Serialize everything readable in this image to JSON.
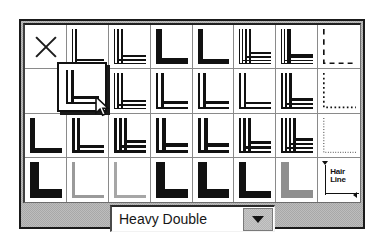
{
  "dialog": {
    "name": "border-style-picker",
    "panel_color": "#a8a8a8",
    "grid_bg": "#ffffff",
    "ink_color": "#111111"
  },
  "grid": {
    "rows": 4,
    "cols": 8,
    "cells": [
      {
        "id": "none",
        "label": "None",
        "kind": "x"
      },
      {
        "id": "r1c2",
        "label": "Thin Double",
        "kind": "lines",
        "strokes": [
          {
            "w": 1,
            "gap": 0
          },
          {
            "w": 2,
            "gap": 2
          }
        ]
      },
      {
        "id": "r1c3",
        "label": "Thin Triple",
        "kind": "lines",
        "strokes": [
          {
            "w": 1,
            "gap": 0
          },
          {
            "w": 2,
            "gap": 2
          },
          {
            "w": 2,
            "gap": 2
          }
        ]
      },
      {
        "id": "r1c4",
        "label": "Heavy Single",
        "kind": "lines",
        "strokes": [
          {
            "w": 6,
            "gap": 0
          }
        ]
      },
      {
        "id": "r1c5",
        "label": "Heavy Single Wide",
        "kind": "lines",
        "strokes": [
          {
            "w": 5,
            "gap": 0
          }
        ]
      },
      {
        "id": "r1c6",
        "label": "Thin Quadruple",
        "kind": "lines",
        "strokes": [
          {
            "w": 1,
            "gap": 0
          },
          {
            "w": 1,
            "gap": 2
          },
          {
            "w": 2,
            "gap": 2
          },
          {
            "w": 2,
            "gap": 2
          }
        ]
      },
      {
        "id": "r1c7",
        "label": "Heavy Double Inner",
        "kind": "lines",
        "strokes": [
          {
            "w": 1,
            "gap": 0
          },
          {
            "w": 1,
            "gap": 2
          },
          {
            "w": 4,
            "gap": 2
          }
        ]
      },
      {
        "id": "r1c8",
        "label": "Dashed",
        "kind": "dash",
        "dash": "6 5",
        "w": 2
      },
      {
        "id": "r2c1",
        "label": "Blank",
        "kind": "blank"
      },
      {
        "id": "r2c2",
        "label": "Heavy Double",
        "kind": "lines",
        "strokes": [
          {
            "w": 2,
            "gap": 0
          },
          {
            "w": 3,
            "gap": 3
          }
        ],
        "selected": true
      },
      {
        "id": "r2c3",
        "label": "Thin Triple B",
        "kind": "lines",
        "strokes": [
          {
            "w": 1,
            "gap": 0
          },
          {
            "w": 2,
            "gap": 2
          },
          {
            "w": 2,
            "gap": 2
          }
        ]
      },
      {
        "id": "r2c4",
        "label": "Double Medium",
        "kind": "lines",
        "strokes": [
          {
            "w": 2,
            "gap": 0
          },
          {
            "w": 3,
            "gap": 3
          }
        ]
      },
      {
        "id": "r2c5",
        "label": "Double Medium B",
        "kind": "lines",
        "strokes": [
          {
            "w": 2,
            "gap": 0
          },
          {
            "w": 3,
            "gap": 3
          }
        ]
      },
      {
        "id": "r2c6",
        "label": "Double Thin",
        "kind": "lines",
        "strokes": [
          {
            "w": 2,
            "gap": 0
          },
          {
            "w": 2,
            "gap": 3
          }
        ]
      },
      {
        "id": "r2c7",
        "label": "Triple Heavy",
        "kind": "lines",
        "strokes": [
          {
            "w": 2,
            "gap": 0
          },
          {
            "w": 2,
            "gap": 2
          },
          {
            "w": 3,
            "gap": 2
          }
        ]
      },
      {
        "id": "r2c8",
        "label": "Dotted",
        "kind": "dot",
        "dash": "2 3",
        "w": 2
      },
      {
        "id": "r3c1",
        "label": "Heavy Plain",
        "kind": "lines",
        "strokes": [
          {
            "w": 5,
            "gap": 0
          }
        ]
      },
      {
        "id": "r3c2",
        "label": "Heavy Outline",
        "kind": "lines",
        "strokes": [
          {
            "w": 3,
            "gap": 0
          },
          {
            "w": 3,
            "gap": 2
          }
        ]
      },
      {
        "id": "r3c3",
        "label": "Heavy Triple",
        "kind": "lines",
        "strokes": [
          {
            "w": 3,
            "gap": 0
          },
          {
            "w": 3,
            "gap": 2
          },
          {
            "w": 3,
            "gap": 2
          }
        ]
      },
      {
        "id": "r3c4",
        "label": "Heavy Double B",
        "kind": "lines",
        "strokes": [
          {
            "w": 3,
            "gap": 0
          },
          {
            "w": 4,
            "gap": 3
          }
        ]
      },
      {
        "id": "r3c5",
        "label": "Heavy Double C",
        "kind": "lines",
        "strokes": [
          {
            "w": 3,
            "gap": 0
          },
          {
            "w": 4,
            "gap": 3
          }
        ]
      },
      {
        "id": "r3c6",
        "label": "Heavy Triple B",
        "kind": "lines",
        "strokes": [
          {
            "w": 2,
            "gap": 0
          },
          {
            "w": 3,
            "gap": 2
          },
          {
            "w": 3,
            "gap": 2
          }
        ]
      },
      {
        "id": "r3c7",
        "label": "Heavy Quad",
        "kind": "lines",
        "strokes": [
          {
            "w": 2,
            "gap": 0
          },
          {
            "w": 2,
            "gap": 2
          },
          {
            "w": 2,
            "gap": 2
          },
          {
            "w": 3,
            "gap": 2
          }
        ]
      },
      {
        "id": "r3c8",
        "label": "Fine Dotted",
        "kind": "dot",
        "dash": "1 2",
        "w": 1
      },
      {
        "id": "r4c1",
        "label": "Extra Heavy",
        "kind": "lines",
        "strokes": [
          {
            "w": 9,
            "gap": 0
          }
        ]
      },
      {
        "id": "r4c2",
        "label": "Light Gray Thin",
        "kind": "lines",
        "strokes": [
          {
            "w": 3,
            "gap": 0
          }
        ],
        "color": "#9a9a9a"
      },
      {
        "id": "r4c3",
        "label": "Light Gray Thin B",
        "kind": "lines",
        "strokes": [
          {
            "w": 3,
            "gap": 0
          }
        ],
        "color": "#a6a6a6"
      },
      {
        "id": "r4c4",
        "label": "Extra Heavy B",
        "kind": "lines",
        "strokes": [
          {
            "w": 9,
            "gap": 0
          }
        ]
      },
      {
        "id": "r4c5",
        "label": "Extra Heavy C",
        "kind": "lines",
        "strokes": [
          {
            "w": 9,
            "gap": 0
          }
        ]
      },
      {
        "id": "r4c6",
        "label": "Heavy Gray Edge",
        "kind": "lines",
        "strokes": [
          {
            "w": 7,
            "gap": 0
          }
        ]
      },
      {
        "id": "r4c7",
        "label": "Heavy Shadowed",
        "kind": "lines",
        "strokes": [
          {
            "w": 4,
            "gap": 0
          },
          {
            "w": 4,
            "gap": 0
          }
        ],
        "color": "#8f8f8f"
      },
      {
        "id": "r4c8",
        "label": "Hair Line",
        "kind": "hairline"
      }
    ]
  },
  "hairline": {
    "line1": "Hair",
    "line2": "Line"
  },
  "combo": {
    "value": "Heavy Double",
    "placeholder": "Select border style",
    "arrow_icon": "chevron-down-icon"
  },
  "cursor": {
    "icon": "mouse-pointer-icon",
    "x": 95,
    "y": 96
  }
}
